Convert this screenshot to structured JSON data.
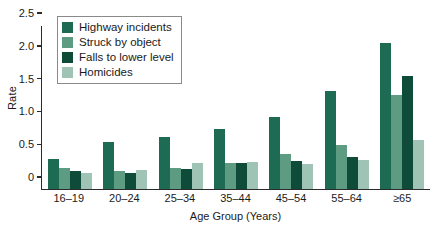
{
  "chart_data": {
    "type": "bar",
    "title": "",
    "xlabel": "Age Group (Years)",
    "ylabel": "Rate",
    "ylim": [
      0,
      2.5
    ],
    "yticks": [
      "0",
      "0.5",
      "1.0",
      "1.5",
      "2.0",
      "2.5"
    ],
    "ytick_values": [
      0,
      0.5,
      1.0,
      1.5,
      2.0,
      2.5
    ],
    "grid": false,
    "legend_position": "upper-left-inside",
    "categories": [
      "16–19",
      "20–24",
      "25–34",
      "35–44",
      "45–54",
      "55–64",
      "≥65"
    ],
    "series": [
      {
        "name": "Highway incidents",
        "color": "#1d6b52",
        "values": [
          0.45,
          0.72,
          0.8,
          0.92,
          1.1,
          1.5,
          2.23
        ]
      },
      {
        "name": "Struck by object",
        "color": "#5e9b83",
        "values": [
          0.32,
          0.27,
          0.32,
          0.39,
          0.53,
          0.67,
          1.43
        ]
      },
      {
        "name": "Falls to lower level",
        "color": "#0e4b38",
        "values": [
          0.28,
          0.24,
          0.31,
          0.39,
          0.42,
          0.49,
          1.72
        ]
      },
      {
        "name": "Homicides",
        "color": "#9fc3b4",
        "values": [
          0.24,
          0.29,
          0.39,
          0.41,
          0.38,
          0.44,
          0.74
        ]
      }
    ]
  }
}
